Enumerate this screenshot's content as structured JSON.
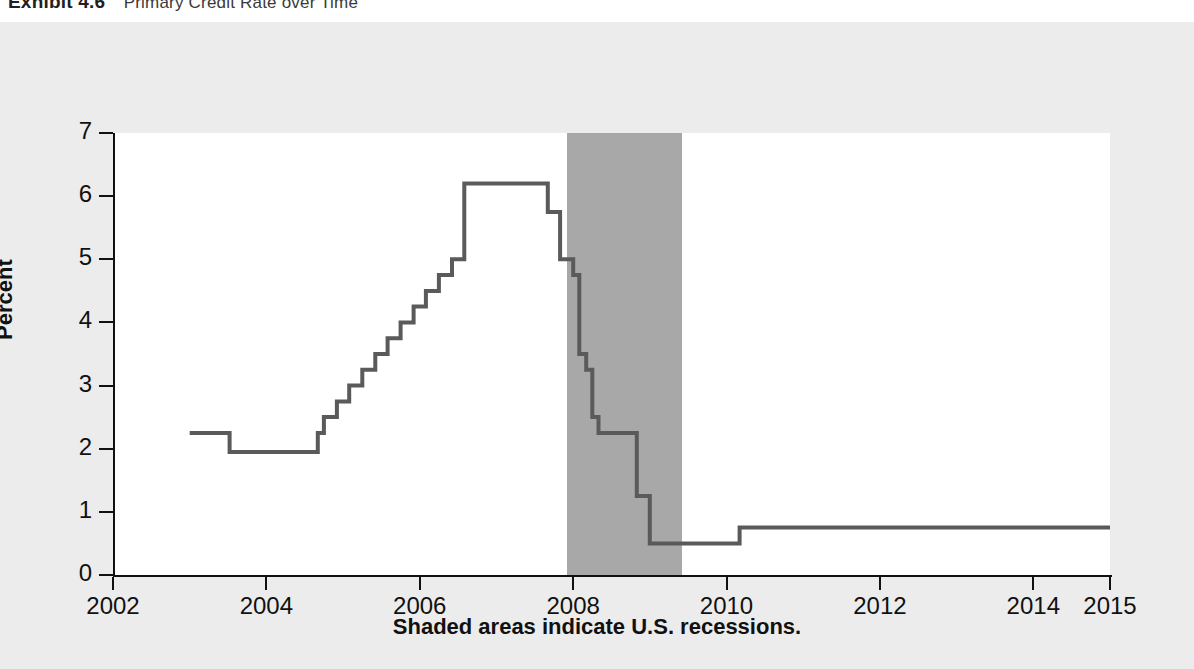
{
  "exhibit": {
    "label": "Exhibit 4.6",
    "title": "Primary Credit Rate over Time"
  },
  "caption": "Shaded areas indicate U.S. recessions.",
  "colors": {
    "line": "#5a5a5a",
    "recession_band": "#a8a8a8",
    "axis": "#111111",
    "plot_background": "#ffffff",
    "page_background": "#ececec"
  },
  "chart_data": {
    "type": "line",
    "title": "Primary Credit Rate over Time",
    "xlabel": "",
    "ylabel": "Percent",
    "grid": false,
    "legend": "none",
    "step": "post",
    "xlim": [
      2002,
      2015
    ],
    "ylim": [
      0,
      7
    ],
    "xticks": [
      2002,
      2004,
      2006,
      2008,
      2010,
      2012,
      2014,
      2015
    ],
    "xtick_labels": [
      "2002",
      "2004",
      "2006",
      "2008",
      "2010",
      "2012",
      "2014",
      "2015"
    ],
    "yticks": [
      0,
      1,
      2,
      3,
      4,
      5,
      6,
      7
    ],
    "ytick_labels": [
      "0",
      "1",
      "2",
      "3",
      "4",
      "5",
      "6",
      "7"
    ],
    "annotations": [
      "Shaded areas indicate U.S. recessions."
    ],
    "shaded_regions": [
      {
        "label": "U.S. recession",
        "x_start": 2007.92,
        "x_end": 2009.42,
        "color": "#a8a8a8"
      }
    ],
    "series": [
      {
        "name": "Primary Credit Rate",
        "x": [
          2003.0,
          2003.52,
          2004.5,
          2004.67,
          2004.75,
          2004.92,
          2005.08,
          2005.25,
          2005.42,
          2005.58,
          2005.75,
          2005.92,
          2006.08,
          2006.25,
          2006.42,
          2006.58,
          2007.67,
          2007.83,
          2008.0,
          2008.08,
          2008.17,
          2008.25,
          2008.33,
          2008.75,
          2008.83,
          2009.0,
          2010.17,
          2015.0
        ],
        "y": [
          2.25,
          1.95,
          1.95,
          2.25,
          2.5,
          2.75,
          3.0,
          3.25,
          3.5,
          3.75,
          4.0,
          4.25,
          4.5,
          4.75,
          5.0,
          6.2,
          5.75,
          5.0,
          4.75,
          3.5,
          3.25,
          2.5,
          2.25,
          2.25,
          1.25,
          0.5,
          0.75,
          0.75
        ]
      }
    ]
  },
  "ghost_text": "the discount rate charged to depository institutions borrowing from the Federal Reserve discount window primary credit is available to generally sound institutions on a very short term basis typically overnight at a rate above the federal funds target the rate moves in step with monetary policy decisions and was cut sharply during the financial crisis"
}
